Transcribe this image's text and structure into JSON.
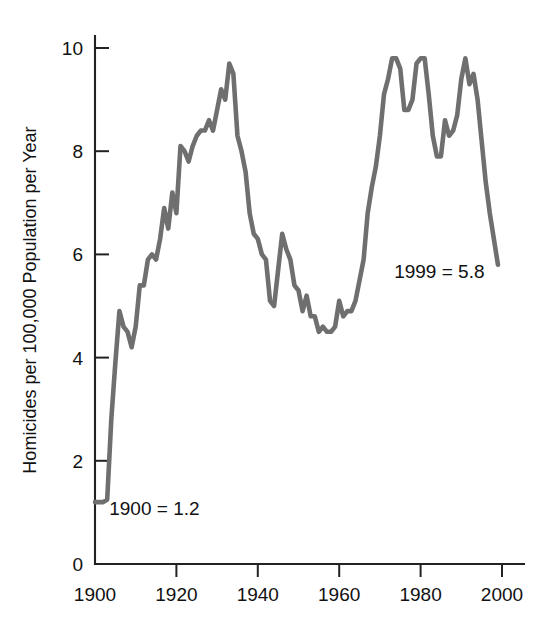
{
  "chart_data": {
    "type": "line",
    "title": "",
    "subtitle": "",
    "xlabel": "",
    "ylabel": "Homicides per 100,000 Population per Year",
    "xlim": [
      1900,
      2000
    ],
    "ylim": [
      0,
      10
    ],
    "grid": false,
    "legend": "none",
    "line_color": "#6f6f6f",
    "line_width": 4.6,
    "x_ticks": [
      1900,
      1920,
      1940,
      1960,
      1980,
      2000
    ],
    "x_tick_labels": [
      "1900",
      "1920",
      "1940",
      "1960",
      "1980",
      "2000"
    ],
    "y_ticks": [
      0,
      2,
      4,
      6,
      8,
      10
    ],
    "y_tick_labels": [
      "0",
      "2",
      "4",
      "6",
      "8",
      "10"
    ],
    "annotations": [
      {
        "text": "1900 = 1.2",
        "x": 1903.5,
        "y": 0.95,
        "anchor": "start"
      },
      {
        "text": "1999 = 5.8",
        "x": 1973.5,
        "y": 5.55,
        "anchor": "start"
      }
    ],
    "series": [
      {
        "name": "US homicide rate",
        "x": [
          1900,
          1901,
          1902,
          1903,
          1904,
          1905,
          1906,
          1907,
          1908,
          1909,
          1910,
          1911,
          1912,
          1913,
          1914,
          1915,
          1916,
          1917,
          1918,
          1919,
          1920,
          1921,
          1922,
          1923,
          1924,
          1925,
          1926,
          1927,
          1928,
          1929,
          1930,
          1931,
          1932,
          1933,
          1934,
          1935,
          1936,
          1937,
          1938,
          1939,
          1940,
          1941,
          1942,
          1943,
          1944,
          1945,
          1946,
          1947,
          1948,
          1949,
          1950,
          1951,
          1952,
          1953,
          1954,
          1955,
          1956,
          1957,
          1958,
          1959,
          1960,
          1961,
          1962,
          1963,
          1964,
          1965,
          1966,
          1967,
          1968,
          1969,
          1970,
          1971,
          1972,
          1973,
          1974,
          1975,
          1976,
          1977,
          1978,
          1979,
          1980,
          1981,
          1982,
          1983,
          1984,
          1985,
          1986,
          1987,
          1988,
          1989,
          1990,
          1991,
          1992,
          1993,
          1994,
          1995,
          1996,
          1997,
          1998,
          1999
        ],
        "values": [
          1.2,
          1.2,
          1.2,
          1.25,
          2.8,
          3.9,
          4.9,
          4.6,
          4.5,
          4.2,
          4.6,
          5.4,
          5.4,
          5.9,
          6.0,
          5.9,
          6.3,
          6.9,
          6.5,
          7.2,
          6.8,
          8.1,
          8.0,
          7.8,
          8.1,
          8.3,
          8.4,
          8.4,
          8.6,
          8.4,
          8.8,
          9.2,
          9.0,
          9.7,
          9.5,
          8.3,
          8.0,
          7.6,
          6.8,
          6.4,
          6.3,
          6.0,
          5.9,
          5.1,
          5.0,
          5.7,
          6.4,
          6.1,
          5.9,
          5.4,
          5.3,
          4.9,
          5.2,
          4.8,
          4.8,
          4.5,
          4.6,
          4.5,
          4.5,
          4.6,
          5.1,
          4.8,
          4.9,
          4.9,
          5.1,
          5.5,
          5.9,
          6.8,
          7.3,
          7.7,
          8.3,
          9.1,
          9.4,
          9.8,
          9.8,
          9.6,
          8.8,
          8.8,
          9.0,
          9.7,
          9.8,
          9.8,
          9.1,
          8.3,
          7.9,
          7.9,
          8.6,
          8.3,
          8.4,
          8.7,
          9.4,
          9.8,
          9.3,
          9.5,
          9.0,
          8.2,
          7.4,
          6.8,
          6.3,
          5.8
        ]
      }
    ]
  },
  "axis": {
    "y_title": "Homicides per 100,000 Population per Year"
  }
}
